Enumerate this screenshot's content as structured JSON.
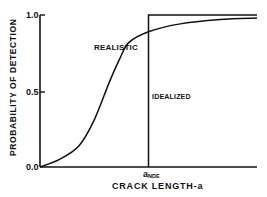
{
  "chart_data": {
    "type": "line",
    "title": "",
    "xlabel": "CRACK LENGTH-a",
    "ylabel": "PROBABILITY OF DETECTION",
    "ylim": [
      0.0,
      1.0
    ],
    "yticks": [
      "0.0",
      "0.5",
      "1.0"
    ],
    "xticks": [],
    "grid": false,
    "legend": null,
    "annotations": [
      {
        "text": "REALISTIC",
        "target": "realistic curve"
      },
      {
        "text": "IDEALIZED",
        "target": "step function"
      },
      {
        "text": "a",
        "subscript": "NDE",
        "position": "x-axis at step location"
      }
    ],
    "x_relative": {
      "a_NDE": 0.5,
      "x_range": [
        0,
        1
      ]
    },
    "series": [
      {
        "name": "REALISTIC",
        "x": [
          0.0,
          0.09,
          0.18,
          0.25,
          0.32,
          0.37,
          0.41,
          0.5,
          0.64,
          0.83,
          1.0
        ],
        "values": [
          0.0,
          0.05,
          0.14,
          0.31,
          0.56,
          0.72,
          0.82,
          0.89,
          0.94,
          0.97,
          0.98
        ]
      },
      {
        "name": "IDEALIZED",
        "x": [
          0.5,
          0.5,
          1.0
        ],
        "values": [
          0.0,
          1.0,
          1.0
        ]
      }
    ]
  },
  "labels": {
    "y_axis": "PROBABILITY OF DETECTION",
    "x_axis": "CRACK LENGTH-a",
    "realistic": "REALISTIC",
    "idealized": "IDEALIZED",
    "a_nde_main": "a",
    "a_nde_sub": "NDE",
    "tick_1": "1.0",
    "tick_05": "0.5",
    "tick_0": "0.0"
  },
  "style": {
    "line_color": "#111111",
    "background": "#ffffff"
  }
}
